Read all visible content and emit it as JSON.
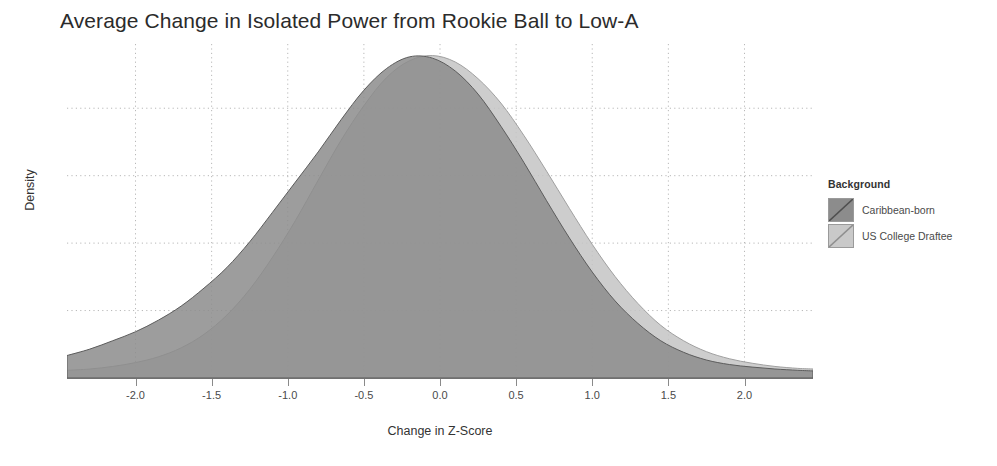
{
  "chart_data": {
    "type": "area",
    "title": "Average Change in Isolated Power from Rookie Ball to Low-A",
    "xlabel": "Change in Z-Score",
    "ylabel": "Density",
    "grid": "dotted both axes",
    "legend_position": "right",
    "legend_title": "Background",
    "xlim": [
      -2.45,
      2.45
    ],
    "ylim": [
      0,
      0.52
    ],
    "xticks": [
      -2.0,
      -1.5,
      -1.0,
      -0.5,
      0.0,
      0.5,
      1.0,
      1.5,
      2.0
    ],
    "xticklabels": [
      "-2.0",
      "-1.5",
      "-1.0",
      "-0.5",
      "0.0",
      "0.5",
      "1.0",
      "1.5",
      "2.0"
    ],
    "yticks": [],
    "yticklabels": [],
    "series": [
      {
        "name": "Caribbean-born",
        "color": "#8c8c8c",
        "fill_opacity": 0.85,
        "distribution": "density",
        "peak_x": -0.15,
        "peak_y": 0.5,
        "spread": 0.78,
        "x": [
          -2.45,
          -2.3,
          -2.15,
          -2.0,
          -1.85,
          -1.7,
          -1.55,
          -1.4,
          -1.25,
          -1.1,
          -0.95,
          -0.8,
          -0.65,
          -0.5,
          -0.35,
          -0.2,
          -0.05,
          0.1,
          0.25,
          0.4,
          0.55,
          0.7,
          0.85,
          1.0,
          1.15,
          1.3,
          1.45,
          1.6,
          1.75,
          1.9,
          2.05,
          2.2,
          2.35,
          2.45
        ],
        "y": [
          0.035,
          0.045,
          0.058,
          0.072,
          0.09,
          0.112,
          0.14,
          0.172,
          0.212,
          0.258,
          0.305,
          0.352,
          0.402,
          0.448,
          0.482,
          0.5,
          0.498,
          0.478,
          0.442,
          0.392,
          0.336,
          0.276,
          0.218,
          0.165,
          0.12,
          0.085,
          0.058,
          0.04,
          0.028,
          0.021,
          0.017,
          0.014,
          0.012,
          0.011
        ]
      },
      {
        "name": "US College Draftee",
        "color": "#c4c4c4",
        "fill_opacity": 0.85,
        "distribution": "density",
        "peak_x": 0.0,
        "peak_y": 0.5,
        "spread": 0.82,
        "x": [
          -2.45,
          -2.3,
          -2.15,
          -2.0,
          -1.85,
          -1.7,
          -1.55,
          -1.4,
          -1.25,
          -1.1,
          -0.95,
          -0.8,
          -0.65,
          -0.5,
          -0.35,
          -0.2,
          -0.05,
          0.1,
          0.25,
          0.4,
          0.55,
          0.7,
          0.85,
          1.0,
          1.15,
          1.3,
          1.45,
          1.6,
          1.75,
          1.9,
          2.05,
          2.2,
          2.35,
          2.45
        ],
        "y": [
          0.012,
          0.014,
          0.018,
          0.024,
          0.033,
          0.047,
          0.068,
          0.098,
          0.138,
          0.188,
          0.245,
          0.308,
          0.37,
          0.424,
          0.468,
          0.494,
          0.502,
          0.492,
          0.466,
          0.428,
          0.378,
          0.322,
          0.264,
          0.208,
          0.158,
          0.116,
          0.082,
          0.058,
          0.041,
          0.03,
          0.023,
          0.018,
          0.015,
          0.014
        ]
      }
    ],
    "annotations": []
  },
  "legend": {
    "title": "Background",
    "entries": [
      {
        "label": "Caribbean-born",
        "color": "#8c8c8c"
      },
      {
        "label": "US College Draftee",
        "color": "#c9c9c9"
      }
    ]
  },
  "colors": {
    "caribbean": "#8c8c8c",
    "college": "#c9c9c9",
    "grid": "#b8b8b8",
    "axis": "#707070",
    "text": "#333333",
    "title": "#2b2b2b"
  }
}
